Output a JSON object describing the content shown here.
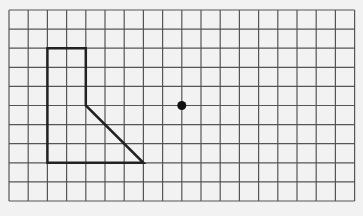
{
  "grid": {
    "columns": 18,
    "rows": 10,
    "origin_x": 9,
    "origin_y": 10,
    "cell_w": 19.2,
    "cell_h": 19.1,
    "line_color": "#555555",
    "background": "#f2f2f2"
  },
  "shape": {
    "name": "L-shaped polygon with slanted edge",
    "vertices": [
      [
        2,
        2
      ],
      [
        4,
        2
      ],
      [
        4,
        5
      ],
      [
        7,
        8
      ],
      [
        2,
        8
      ]
    ],
    "stroke": "#222222",
    "stroke_width": 2.5
  },
  "point": {
    "name": "center point",
    "grid_x": 9,
    "grid_y": 5,
    "radius": 4.5,
    "color": "#111111"
  }
}
